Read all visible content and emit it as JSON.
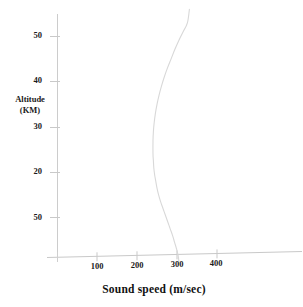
{
  "chart_data": {
    "type": "line",
    "title": "",
    "xlabel": "Sound speed (m/sec)",
    "ylabel": "Altitude\n(KM)",
    "ylabel_line1": "Altitude",
    "ylabel_line2": "(KM)",
    "xlim": [
      0,
      480
    ],
    "ylim": [
      0,
      58
    ],
    "xticks": [
      100,
      200,
      300,
      400
    ],
    "xtick_labels": [
      "100",
      "200",
      "300",
      "400"
    ],
    "yticks": [
      10,
      20,
      30,
      40,
      50
    ],
    "ytick_labels": [
      "10",
      "20",
      "30",
      "40",
      "50"
    ],
    "grid": false,
    "legend": null,
    "series": [
      {
        "name": "Sound speed profile",
        "color": "#d8d8d8",
        "x": [
          305,
          303,
          299,
          294,
          289,
          283,
          277,
          271,
          265,
          259,
          254,
          250,
          247,
          244,
          242,
          241,
          240,
          240,
          241,
          243,
          246,
          250,
          255,
          261,
          268,
          276,
          285,
          294,
          304,
          315,
          326,
          331
        ],
        "y": [
          0,
          1.5,
          3,
          4.5,
          6,
          7.5,
          9,
          10.5,
          12,
          13.5,
          15,
          16.5,
          18,
          19.5,
          21,
          22.5,
          24,
          27,
          29,
          31,
          33,
          35,
          37,
          39,
          41,
          43,
          45,
          47,
          49,
          51,
          53,
          56
        ]
      }
    ]
  },
  "axes": {
    "axis_color": "#c9c9c9",
    "tick_color": "#c9c9c9",
    "curve_color": "#dcdcdc",
    "text_color": "#1a1a1a"
  },
  "ytick_positions": [
    {
      "label": "10",
      "top": 213
    },
    {
      "label": "20",
      "top": 168
    },
    {
      "label": "30",
      "top": 113
    },
    {
      "label": "40",
      "top": 73
    },
    {
      "label": "50",
      "top": 31
    }
  ],
  "xtick_positions": [
    {
      "label": "100",
      "left": 88
    },
    {
      "label": "200",
      "left": 128
    },
    {
      "label": "300",
      "left": 168
    },
    {
      "label": "400",
      "left": 207
    }
  ]
}
